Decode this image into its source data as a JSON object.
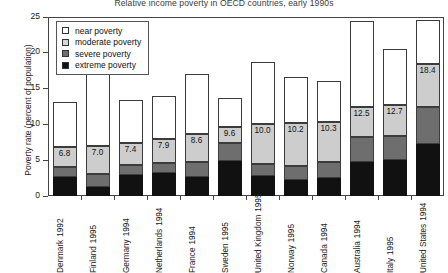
{
  "chart_data": {
    "type": "bar",
    "subtype": "stacked-bar",
    "title": "Relative income poverty in OECD countries, early 1990s",
    "xlabel": "",
    "ylabel": "Poverty rate (percent of population)",
    "ylim": [
      0,
      25
    ],
    "yticks": [
      0,
      5,
      10,
      15,
      20,
      25
    ],
    "grid": false,
    "legend_position": "top-left inside plot",
    "categories": [
      "Denmark 1992",
      "Finland 1995",
      "Germany 1994",
      "Netherlands 1994",
      "France 1994",
      "Sweden 1995",
      "United Kingdom 1995",
      "Norway 1995",
      "Canada 1994",
      "Australia 1994",
      "Italy 1995",
      "United States 1994"
    ],
    "category_names": [
      "Denmark",
      "Finland",
      "Germany",
      "Netherlands",
      "France",
      "Sweden",
      "United Kingdom",
      "Norway",
      "Canada",
      "Australia",
      "Italy",
      "United States"
    ],
    "category_years": [
      "1992",
      "1995",
      "1994",
      "1994",
      "1994",
      "1995",
      "1995",
      "1995",
      "1994",
      "1994",
      "1995",
      "1994"
    ],
    "series": [
      {
        "name": "extreme poverty",
        "color": "#111111",
        "values": [
          2.6,
          1.3,
          3.0,
          3.2,
          2.6,
          4.9,
          2.8,
          2.2,
          2.5,
          4.8,
          5.0,
          7.3
        ]
      },
      {
        "name": "severe poverty",
        "color": "#6e6e6e",
        "values": [
          1.5,
          1.8,
          1.4,
          1.4,
          2.1,
          2.5,
          1.7,
          2.0,
          2.3,
          3.5,
          3.4,
          5.2
        ]
      },
      {
        "name": "moderate poverty",
        "color": "#cdcdcd",
        "values": [
          2.7,
          3.9,
          3.0,
          3.3,
          3.9,
          2.2,
          5.5,
          6.0,
          5.5,
          4.2,
          4.3,
          5.9
        ]
      },
      {
        "name": "near poverty",
        "color": "#ffffff",
        "values": [
          6.4,
          10.4,
          6.0,
          6.1,
          8.4,
          4.1,
          8.7,
          6.4,
          5.7,
          12.0,
          7.9,
          6.2
        ]
      }
    ],
    "data_labels": [
      "6.8",
      "7.0",
      "7.4",
      "7.9",
      "8.6",
      "9.6",
      "10.0",
      "10.2",
      "10.3",
      "12.5",
      "12.7",
      "18.4"
    ],
    "data_label_note": "value at top of moderate poverty segment (cumulative extreme + severe + moderate)",
    "totals": [
      13.4,
      17.4,
      13.4,
      14.0,
      17.0,
      13.7,
      18.7,
      16.6,
      16.0,
      24.5,
      20.6,
      24.6
    ]
  },
  "legend": {
    "items": [
      {
        "label": "near poverty",
        "key": "near"
      },
      {
        "label": "moderate poverty",
        "key": "moderate"
      },
      {
        "label": "severe poverty",
        "key": "severe"
      },
      {
        "label": "extreme poverty",
        "key": "extreme"
      }
    ]
  }
}
